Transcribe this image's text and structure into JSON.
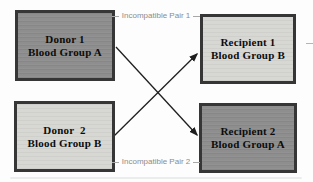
{
  "diagram": {
    "type": "paired-exchange-flow",
    "boxes": [
      {
        "name": "donor-1",
        "line1": "Donor 1",
        "line2": "Blood Group A",
        "variant": "dark"
      },
      {
        "name": "recipient-1",
        "line1": "Recipient 1",
        "line2": "Blood Group B",
        "variant": "light"
      },
      {
        "name": "donor-2",
        "line1": "Donor  2",
        "line2": "Blood Group B",
        "variant": "light"
      },
      {
        "name": "recipient-2",
        "line1": "Recipient 2",
        "line2": "Blood Group A",
        "variant": "dark"
      }
    ],
    "pair_labels": {
      "pair1": "Incompatible Pair 1",
      "pair2": "Incompatible Pair 2"
    },
    "arrows": [
      {
        "from": "donor-1",
        "to": "recipient-2"
      },
      {
        "from": "donor-2",
        "to": "recipient-1"
      }
    ],
    "colors": {
      "dark_box_fill": "#8e8e8e",
      "light_box_fill": "#d7d7d4",
      "box_border": "#363636",
      "box_text": "#0c0c0c",
      "pair_label_text": "#8c8c8c",
      "arrow": "#1f1f1f",
      "background": "#fdfdfd"
    }
  }
}
